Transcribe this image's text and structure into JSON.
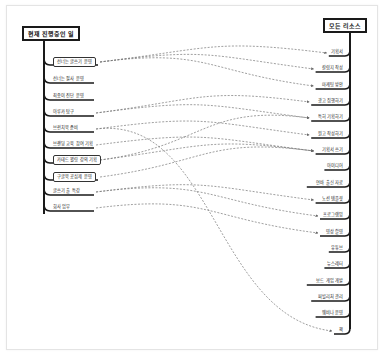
{
  "left_tree": {
    "title": "현재 진행중인 일",
    "items": [
      {
        "label": "선너는 글쓰기 운영",
        "boxed": true,
        "y": 64
      },
      {
        "label": "선너는 필사 운영",
        "boxed": false,
        "y": 82
      },
      {
        "label": "최종이 진단 운영",
        "boxed": false,
        "y": 99
      },
      {
        "label": "아루카 탐구",
        "boxed": false,
        "y": 115
      },
      {
        "label": "브런치북 준비",
        "boxed": false,
        "y": 131
      },
      {
        "label": "브랜딩 교육 참여 기획",
        "boxed": false,
        "y": 147
      },
      {
        "label": "카테드 웰링 강의 기획",
        "boxed": true,
        "y": 162
      },
      {
        "label": "구글북 공심제 운영",
        "boxed": true,
        "y": 179
      },
      {
        "label": "글쓰기 출 특강",
        "boxed": false,
        "y": 194
      },
      {
        "label": "회사 업무",
        "boxed": false,
        "y": 210
      }
    ]
  },
  "right_tree": {
    "title": "모든 리소스",
    "items": [
      {
        "label": "기획서",
        "y": 55
      },
      {
        "label": "칼럼지 작성",
        "y": 71
      },
      {
        "label": "마케팅 방안",
        "y": 88
      },
      {
        "label": "광고 집행하기",
        "y": 104
      },
      {
        "label": "특허 기획하기",
        "y": 120
      },
      {
        "label": "원고 작성하기",
        "y": 137
      },
      {
        "label": "기획서 쓰기",
        "y": 153
      },
      {
        "label": "아이디어",
        "y": 169
      },
      {
        "label": "연바 출신 자료",
        "y": 186
      },
      {
        "label": "노션 템플릿",
        "y": 202
      },
      {
        "label": "프로그램밍",
        "y": 218
      },
      {
        "label": "영상 촬영",
        "y": 235
      },
      {
        "label": "유튜브",
        "y": 251
      },
      {
        "label": "뉴스레터",
        "y": 267
      },
      {
        "label": "보드 게임 개발",
        "y": 284
      },
      {
        "label": "퍼빌리처 관리",
        "y": 300
      },
      {
        "label": "웨비나 운영",
        "y": 316
      },
      {
        "label": "책",
        "y": 333
      }
    ]
  },
  "connections": [
    {
      "from": 0,
      "to": 0
    },
    {
      "from": 0,
      "to": 1
    },
    {
      "from": 0,
      "to": 2
    },
    {
      "from": 3,
      "to": 3
    },
    {
      "from": 3,
      "to": 4
    },
    {
      "from": 4,
      "to": 5
    },
    {
      "from": 4,
      "to": 17
    },
    {
      "from": 5,
      "to": 6
    },
    {
      "from": 6,
      "to": 4
    },
    {
      "from": 6,
      "to": 6
    },
    {
      "from": 7,
      "to": 6
    },
    {
      "from": 8,
      "to": 9
    },
    {
      "from": 8,
      "to": 10
    },
    {
      "from": 9,
      "to": 11
    }
  ],
  "colors": {
    "line": "#1a1a1a",
    "dash": "#777777",
    "card_border": "#e4e4e4"
  }
}
